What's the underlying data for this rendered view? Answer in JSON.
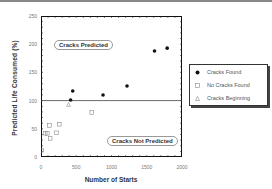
{
  "chart_data": {
    "type": "scatter",
    "title": "",
    "xlabel": "Number of Starts",
    "ylabel": "Predicted Life Consumed  (%)",
    "xlim": [
      0,
      2000
    ],
    "ylim": [
      0,
      250
    ],
    "x_ticks": [
      "0",
      "500",
      "1000",
      "1500",
      "2000"
    ],
    "y_ticks": [
      "0",
      "50",
      "100",
      "150",
      "200",
      "250"
    ],
    "grid": false,
    "legend_position": "right",
    "reference_line": {
      "y": 100,
      "label": "100% life consumed threshold"
    },
    "annotations": [
      {
        "text": "Cracks Predicted",
        "x": 400,
        "y": 200
      },
      {
        "text": "Cracks Not Predicted",
        "x": 1450,
        "y": 30
      }
    ],
    "series": [
      {
        "name": "Cracks Found",
        "marker": "filled-circle",
        "points": [
          [
            420,
            101
          ],
          [
            450,
            117
          ],
          [
            880,
            110
          ],
          [
            1220,
            126
          ],
          [
            1610,
            188
          ],
          [
            1790,
            193
          ]
        ]
      },
      {
        "name": "No Cracks Found",
        "marker": "open-square",
        "points": [
          [
            10,
            12
          ],
          [
            60,
            42
          ],
          [
            90,
            42
          ],
          [
            120,
            56
          ],
          [
            130,
            33
          ],
          [
            220,
            43
          ],
          [
            260,
            58
          ],
          [
            720,
            79
          ]
        ]
      },
      {
        "name": "Cracks Beginning",
        "marker": "open-triangle",
        "points": [
          [
            390,
            93
          ]
        ]
      }
    ]
  },
  "labels": {
    "xlabel": "Number of Starts",
    "ylabel": "Predicted Life Consumed  (%)",
    "cracks_predicted": "Cracks Predicted",
    "cracks_not_predicted": "Cracks Not Predicted"
  },
  "ticks": {
    "x": [
      "0",
      "500",
      "1000",
      "1500",
      "2000"
    ],
    "y": [
      "0",
      "50",
      "100",
      "150",
      "200",
      "250"
    ]
  },
  "legend": {
    "items": [
      {
        "label": "Cracks Found",
        "marker": "●"
      },
      {
        "label": "No Cracks Found",
        "marker": "□"
      },
      {
        "label": "Cracks Beginning",
        "marker": "△"
      }
    ]
  }
}
